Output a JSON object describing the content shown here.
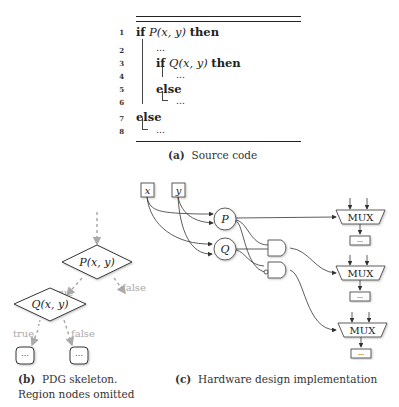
{
  "source_code": {
    "lines": [
      {
        "num": "1",
        "kw": "if",
        "cond": "P(x, y)",
        "kw2": "then"
      },
      {
        "num": "2",
        "text": "…"
      },
      {
        "num": "3",
        "kw": "if",
        "cond": "Q(x, y)",
        "kw2": "then"
      },
      {
        "num": "4",
        "text": "…"
      },
      {
        "num": "5",
        "kw": "else"
      },
      {
        "num": "6",
        "text": "…"
      },
      {
        "num": "7",
        "kw": "else"
      },
      {
        "num": "8",
        "text": "…"
      }
    ],
    "caption_label": "(a)",
    "caption_text": "Source code"
  },
  "pdg": {
    "node_p": "P(x, y)",
    "node_q": "Q(x, y)",
    "edge_true_1": "true",
    "edge_false_1": "false",
    "edge_true_2": "true",
    "edge_false_2": "false",
    "leaf_1": "⋯",
    "leaf_2": "⋯",
    "caption_label": "(b)",
    "caption_line1": "PDG skeleton.",
    "caption_line2": "Region nodes omitted"
  },
  "hardware": {
    "input_x": "x",
    "input_y": "y",
    "node_p": "P",
    "node_q": "Q",
    "mux_1": "MUX",
    "mux_2": "MUX",
    "mux_3": "MUX",
    "out_1": "⋯",
    "out_2": "⋯",
    "out_3": "⋯",
    "caption_label": "(c)",
    "caption_text": "Hardware design implementation"
  }
}
